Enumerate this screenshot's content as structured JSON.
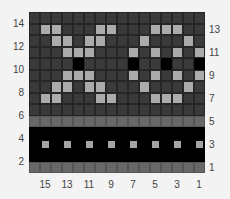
{
  "chart": {
    "type": "knitting-colorwork-chart",
    "columns": 16,
    "rows": 14,
    "row_labels_left": [
      "14",
      "12",
      "10",
      "8",
      "6",
      "4",
      "2"
    ],
    "row_labels_right": [
      "13",
      "11",
      "9",
      "7",
      "5",
      "3",
      "1"
    ],
    "column_labels": [
      "15",
      "13",
      "11",
      "9",
      "7",
      "5",
      "3",
      "1"
    ],
    "legend_colors": {
      "D": "#3a3a3a",
      "L": "#ababab",
      "K": "#000000",
      "M": "#686868",
      "B": "#000000",
      "S": "#a4a4a4"
    },
    "grid_rows_top_to_bottom": [
      "DDDDDDDDDDDDDDDD",
      "DLLDDDLLDDDLLLDD",
      "DDLLDLLDDDLDDDLD",
      "DDDLLLDDDLDLDLDL",
      "DDDDKDDDDKDDKDDK",
      "DDDLLLDDDLDLDLDL",
      "DDLLDLLDDDLDDDLD",
      "DLLDDDLLDDDLLLDD",
      "DDDDDDDDDDDDDDDD",
      "MMMMMMMMMMMMMMMM",
      "BBBBBBBBBBBBBBBB",
      "BSBSBSBSBSBSBSBS",
      "BBBBBBBBBBBBBBBB",
      "MMMMMMMMMMMMMMMM"
    ]
  }
}
